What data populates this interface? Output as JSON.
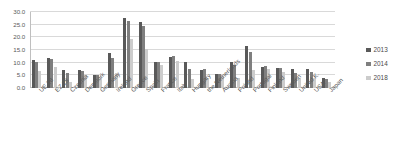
{
  "chart_data": {
    "type": "bar",
    "title": "",
    "subtitle": "",
    "xlabel": "",
    "ylabel": "",
    "ylim": [
      0,
      30
    ],
    "ytick_labels": [
      "0.0",
      "5.0",
      "10.0",
      "15.0",
      "20.0",
      "25.0",
      "30.0"
    ],
    "ytick_values": [
      0,
      5,
      10,
      15,
      20,
      25,
      30
    ],
    "grid": true,
    "legend_position": "right",
    "categories": [
      "UE 28",
      "EZ 18",
      "Czechia",
      "Denmark",
      "Germany",
      "Ireland",
      "Greece",
      "Spain",
      "France",
      "Italy",
      "Hungary",
      "the Netherlands",
      "Austria",
      "Poland",
      "Portugal",
      "Finland",
      "Sweden",
      "United K.",
      "USA",
      "Japan"
    ],
    "series": [
      {
        "name": "2013",
        "color": "#595959",
        "values": [
          10.9,
          12.0,
          7.0,
          7.0,
          5.2,
          13.8,
          27.5,
          26.1,
          10.3,
          12.2,
          10.2,
          7.3,
          5.4,
          10.3,
          16.4,
          8.2,
          8.0,
          7.6,
          7.4,
          4.0
        ]
      },
      {
        "name": "2014",
        "color": "#7f7f7f",
        "values": [
          10.2,
          11.6,
          6.1,
          6.6,
          5.0,
          11.9,
          26.5,
          24.5,
          10.3,
          12.7,
          7.7,
          7.4,
          5.6,
          9.0,
          14.1,
          8.7,
          7.9,
          6.1,
          6.2,
          3.6
        ]
      },
      {
        "name": "2018",
        "color": "#cccccc",
        "values": [
          6.8,
          8.2,
          2.2,
          5.0,
          3.4,
          5.8,
          19.3,
          15.3,
          9.1,
          10.6,
          3.7,
          3.8,
          4.9,
          3.9,
          7.0,
          7.4,
          6.3,
          4.0,
          3.9,
          2.4
        ]
      }
    ]
  },
  "legend": {
    "items": [
      {
        "label": "2013",
        "color": "#595959"
      },
      {
        "label": "2014",
        "color": "#7f7f7f"
      },
      {
        "label": "2018",
        "color": "#cccccc"
      }
    ]
  }
}
